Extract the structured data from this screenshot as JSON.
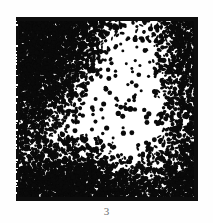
{
  "figure": {
    "caption": "3",
    "panel": {
      "name": "stochastic-dot-texture",
      "border_color": "#0d0d0d",
      "background_color": "#ffffff",
      "ink_color": "#0a0a0a",
      "left": 16,
      "top": 17,
      "width": 182,
      "height": 184,
      "border_width_top": 4,
      "border_width_right": 4,
      "border_width_bottom": 4,
      "border_width_left": 3
    }
  },
  "chart_data": {
    "type": "heatmap",
    "title": "",
    "subtitle": "",
    "xlabel": "",
    "ylabel": "",
    "grid": false,
    "legend": false,
    "colormap": [
      "#ffffff",
      "#0a0a0a"
    ],
    "field_width": 182,
    "field_height": 184,
    "density_units": "fraction of area covered by ink (0 = white, 1 = solid black)",
    "density_min": 0.02,
    "density_max": 0.62,
    "density_grid_x": [
      0,
      0.125,
      0.25,
      0.375,
      0.5,
      0.625,
      0.75,
      0.875,
      1.0
    ],
    "density_grid_y": [
      0,
      0.125,
      0.25,
      0.375,
      0.5,
      0.625,
      0.75,
      0.875,
      1.0
    ],
    "density_values": [
      [
        0.6,
        0.58,
        0.52,
        0.4,
        0.22,
        0.1,
        0.16,
        0.34,
        0.44
      ],
      [
        0.58,
        0.55,
        0.48,
        0.34,
        0.14,
        0.07,
        0.12,
        0.3,
        0.42
      ],
      [
        0.56,
        0.52,
        0.42,
        0.24,
        0.09,
        0.06,
        0.1,
        0.26,
        0.4
      ],
      [
        0.54,
        0.48,
        0.32,
        0.14,
        0.06,
        0.05,
        0.08,
        0.22,
        0.38
      ],
      [
        0.46,
        0.36,
        0.18,
        0.08,
        0.05,
        0.05,
        0.07,
        0.2,
        0.34
      ],
      [
        0.34,
        0.22,
        0.12,
        0.08,
        0.07,
        0.06,
        0.08,
        0.18,
        0.3
      ],
      [
        0.28,
        0.24,
        0.26,
        0.24,
        0.16,
        0.1,
        0.12,
        0.22,
        0.34
      ],
      [
        0.4,
        0.46,
        0.52,
        0.5,
        0.38,
        0.26,
        0.24,
        0.32,
        0.44
      ],
      [
        0.5,
        0.58,
        0.62,
        0.6,
        0.52,
        0.42,
        0.38,
        0.44,
        0.52
      ]
    ],
    "sparse_dot_diameter_px": 4,
    "cluster_blob_size_px": 3
  }
}
